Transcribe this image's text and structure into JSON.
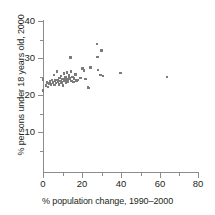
{
  "chart_data": {
    "type": "scatter",
    "title": "",
    "xlabel": "% population change, 1990–2000",
    "ylabel": "% persons under 18 years old, 2000",
    "xlim": [
      0,
      80
    ],
    "ylim": [
      0,
      40
    ],
    "xticks": [
      0,
      20,
      40,
      60,
      80
    ],
    "xticks_minor": [
      10,
      30,
      50,
      70
    ],
    "yticks": [
      10,
      20,
      30,
      40
    ],
    "grid": false,
    "legend": null,
    "marker": {
      "shape": "square",
      "color": "#7b7b7b",
      "size_px": 2.6
    },
    "points": [
      {
        "x": 0.0,
        "y": 24.2
      },
      {
        "x": 0.0,
        "y": 21.2
      },
      {
        "x": 1.5,
        "y": 22.6
      },
      {
        "x": 2.1,
        "y": 23.4
      },
      {
        "x": 2.6,
        "y": 22.2
      },
      {
        "x": 3.1,
        "y": 23.1
      },
      {
        "x": 3.6,
        "y": 23.7
      },
      {
        "x": 4.1,
        "y": 22.8
      },
      {
        "x": 4.6,
        "y": 24.1
      },
      {
        "x": 5.2,
        "y": 23.3
      },
      {
        "x": 5.7,
        "y": 25.4
      },
      {
        "x": 5.9,
        "y": 22.7
      },
      {
        "x": 6.2,
        "y": 23.9
      },
      {
        "x": 6.7,
        "y": 23.2
      },
      {
        "x": 7.2,
        "y": 26.3
      },
      {
        "x": 7.4,
        "y": 24.0
      },
      {
        "x": 7.8,
        "y": 23.5
      },
      {
        "x": 8.2,
        "y": 22.9
      },
      {
        "x": 8.6,
        "y": 24.6
      },
      {
        "x": 9.0,
        "y": 23.8
      },
      {
        "x": 9.3,
        "y": 25.1
      },
      {
        "x": 9.7,
        "y": 23.3
      },
      {
        "x": 10.1,
        "y": 24.3
      },
      {
        "x": 10.4,
        "y": 22.6
      },
      {
        "x": 10.8,
        "y": 25.8
      },
      {
        "x": 11.1,
        "y": 23.9
      },
      {
        "x": 11.5,
        "y": 24.8
      },
      {
        "x": 11.9,
        "y": 23.4
      },
      {
        "x": 12.3,
        "y": 26.1
      },
      {
        "x": 12.6,
        "y": 24.2
      },
      {
        "x": 13.0,
        "y": 23.6
      },
      {
        "x": 13.4,
        "y": 25.2
      },
      {
        "x": 13.8,
        "y": 24.5
      },
      {
        "x": 14.2,
        "y": 30.2
      },
      {
        "x": 14.4,
        "y": 26.4
      },
      {
        "x": 14.8,
        "y": 23.8
      },
      {
        "x": 15.2,
        "y": 24.9
      },
      {
        "x": 15.6,
        "y": 23.5
      },
      {
        "x": 16.1,
        "y": 24.4
      },
      {
        "x": 16.8,
        "y": 25.6
      },
      {
        "x": 17.4,
        "y": 23.9
      },
      {
        "x": 18.1,
        "y": 24.1
      },
      {
        "x": 19.3,
        "y": 24.6
      },
      {
        "x": 20.4,
        "y": 27.1
      },
      {
        "x": 21.2,
        "y": 26.7
      },
      {
        "x": 21.8,
        "y": 24.3
      },
      {
        "x": 23.2,
        "y": 22.1
      },
      {
        "x": 23.8,
        "y": 21.9
      },
      {
        "x": 24.6,
        "y": 27.4
      },
      {
        "x": 27.9,
        "y": 33.8
      },
      {
        "x": 28.1,
        "y": 30.3
      },
      {
        "x": 28.4,
        "y": 26.8
      },
      {
        "x": 29.6,
        "y": 25.4
      },
      {
        "x": 30.1,
        "y": 32.1
      },
      {
        "x": 31.0,
        "y": 25.1
      },
      {
        "x": 40.0,
        "y": 26.0
      },
      {
        "x": 64.0,
        "y": 24.9
      }
    ]
  }
}
